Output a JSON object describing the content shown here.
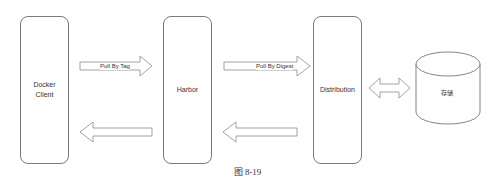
{
  "nodes": {
    "docker_client": "Docker\nClient",
    "harbor": "Harbor",
    "distribution": "Distribution",
    "storage": "存储"
  },
  "edges": {
    "pull_by_tag": "Pull By Tag",
    "pull_by_digest": "Pull By Digest"
  },
  "caption": "图 8-19"
}
